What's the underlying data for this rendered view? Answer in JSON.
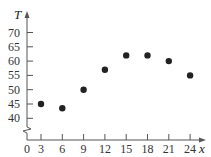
{
  "chart_data": {
    "type": "scatter",
    "title": "",
    "xlabel": "x",
    "ylabel": "T",
    "x_ticks": [
      0,
      3,
      6,
      9,
      12,
      15,
      18,
      21,
      24
    ],
    "y_ticks": [
      40,
      45,
      50,
      55,
      60,
      65,
      70
    ],
    "x_tick_labels": [
      "0",
      "3",
      "6",
      "9",
      "12",
      "15",
      "18",
      "21",
      "24"
    ],
    "y_tick_labels": [
      "40",
      "45",
      "50",
      "55",
      "60",
      "65",
      "70"
    ],
    "xlim": [
      0,
      25
    ],
    "ylim": [
      40,
      72
    ],
    "y_axis_break": true,
    "grid": false,
    "legend": null,
    "series": [
      {
        "name": "T",
        "x": [
          3,
          6,
          9,
          12,
          15,
          18,
          21,
          24
        ],
        "values": [
          45,
          43.5,
          50,
          57,
          62,
          62,
          60,
          55
        ]
      }
    ],
    "colors": {
      "points": "#222222",
      "axes": "#555555",
      "text": "#333333"
    }
  }
}
